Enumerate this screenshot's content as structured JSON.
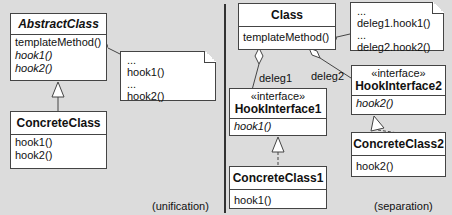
{
  "unification": {
    "caption": "(unification)",
    "abstract_class": {
      "name": "AbstractClass",
      "methods": [
        "templateMethod()",
        "hook1()",
        "hook2()"
      ]
    },
    "note": {
      "lines": [
        "...",
        "hook1()",
        "...",
        "hook2()"
      ]
    },
    "concrete_class": {
      "name": "ConcreteClass",
      "methods": [
        "hook1()",
        "hook2()"
      ]
    }
  },
  "separation": {
    "caption": "(separation)",
    "class": {
      "name": "Class",
      "methods": [
        "templateMethod()"
      ]
    },
    "note": {
      "lines": [
        "...",
        "deleg1.hook1()",
        "...",
        "deleg2.hook2()"
      ]
    },
    "assoc1_label": "deleg1",
    "assoc2_label": "deleg2",
    "hook_interface1": {
      "stereotype": "«interface»",
      "name": "HookInterface1",
      "methods": [
        "hook1()"
      ]
    },
    "hook_interface2": {
      "stereotype": "«interface»",
      "name": "HookInterface2",
      "methods": [
        "hook2()"
      ]
    },
    "concrete_class1": {
      "name": "ConcreteClass1",
      "methods": [
        "hook1()"
      ]
    },
    "concrete_class2": {
      "name": "ConcreteClass2",
      "methods": [
        "hook2()"
      ]
    }
  }
}
